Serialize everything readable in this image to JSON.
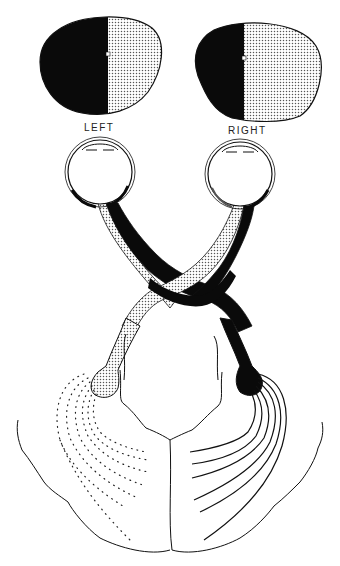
{
  "figure": {
    "type": "visual-pathway-diagram",
    "colors": {
      "solid": "#0a0a0a",
      "stipple": "#cfcfcf",
      "outline": "#1a1a1a",
      "background": "#ffffff"
    },
    "visual_fields": [
      {
        "side": "left",
        "label": "LEFT",
        "black_portion": "left half",
        "stippled_portion": "right half"
      },
      {
        "side": "right",
        "label": "RIGHT",
        "black_portion": "left half",
        "stippled_portion": "right half"
      }
    ],
    "structures": [
      "left-visual-field",
      "right-visual-field",
      "left-eye",
      "right-eye",
      "left-optic-nerve",
      "right-optic-nerve",
      "optic-chiasm",
      "left-optic-tract",
      "right-optic-tract",
      "left-lateral-geniculate",
      "right-lateral-geniculate",
      "left-optic-radiation-dotted",
      "right-optic-radiation-solid",
      "occipital-cortex-outline"
    ]
  },
  "labels": {
    "left": "LEFT",
    "right": "RIGHT"
  }
}
